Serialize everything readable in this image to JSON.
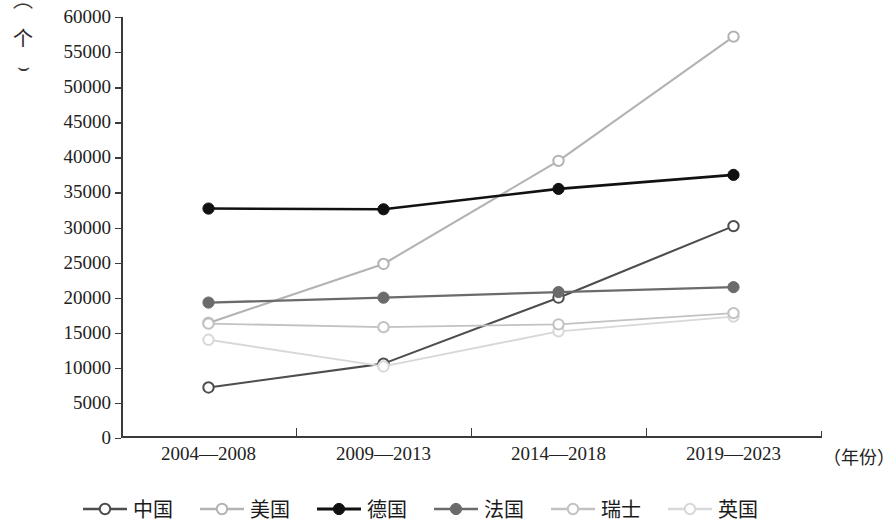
{
  "chart_data": {
    "type": "line",
    "title": "",
    "xlabel": "年份",
    "ylabel": "个",
    "x_unit_suffix": "（年份）",
    "y_unit_label": "个",
    "categories": [
      "2004—2008",
      "2009—2013",
      "2014—2018",
      "2019—2023"
    ],
    "ylim": [
      0,
      60000
    ],
    "ytick_step": 5000,
    "yticks": [
      "0",
      "5000",
      "10000",
      "15000",
      "20000",
      "25000",
      "30000",
      "35000",
      "40000",
      "45000",
      "50000",
      "55000",
      "60000"
    ],
    "grid": false,
    "legend_position": "bottom",
    "series": [
      {
        "name": "中国",
        "values": [
          7200,
          10600,
          20000,
          30200
        ],
        "color": "#4d4d4d",
        "marker": "hollow-circle",
        "line_width": 2.1
      },
      {
        "name": "美国",
        "values": [
          16400,
          24800,
          39500,
          57200
        ],
        "color": "#b3b3b3",
        "marker": "hollow-circle",
        "line_width": 2.1
      },
      {
        "name": "德国",
        "values": [
          32700,
          32600,
          35500,
          37500
        ],
        "color": "#111111",
        "marker": "filled-circle",
        "line_width": 2.6
      },
      {
        "name": "法国",
        "values": [
          19300,
          20000,
          20800,
          21500
        ],
        "color": "#6b6b6b",
        "marker": "filled-circle",
        "line_width": 2.3
      },
      {
        "name": "瑞士",
        "values": [
          16300,
          15800,
          16200,
          17800
        ],
        "color": "#c2c2c2",
        "marker": "hollow-circle",
        "line_width": 1.9
      },
      {
        "name": "英国",
        "values": [
          14000,
          10200,
          15200,
          17300
        ],
        "color": "#d8d8d8",
        "marker": "hollow-circle",
        "line_width": 1.9
      }
    ]
  },
  "axis": {
    "unit_paren_open": "⌒",
    "unit_paren_close": "⌣",
    "unit_glyph": "个"
  }
}
